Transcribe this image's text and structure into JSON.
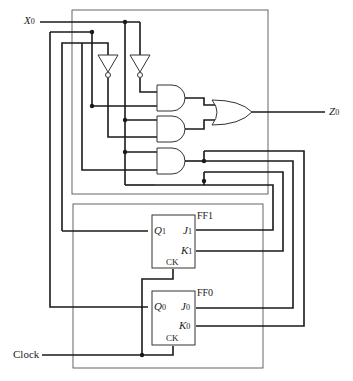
{
  "diagram": {
    "type": "sequential-logic-circuit",
    "inputs": {
      "x0": {
        "label": "X",
        "subscript": "0"
      },
      "clock": {
        "label": "Clock"
      }
    },
    "outputs": {
      "z0": {
        "label": "Z",
        "subscript": "0"
      }
    },
    "flip_flops": [
      {
        "name": "FF1",
        "q": {
          "label": "Q",
          "subscript": "1"
        },
        "j": {
          "label": "J",
          "subscript": "1"
        },
        "k": {
          "label": "K",
          "subscript": "1"
        },
        "ck": "CK"
      },
      {
        "name": "FF0",
        "q": {
          "label": "Q",
          "subscript": "0"
        },
        "j": {
          "label": "J",
          "subscript": "0"
        },
        "k": {
          "label": "K",
          "subscript": "0"
        },
        "ck": "CK"
      }
    ],
    "gates": {
      "inverters": 2,
      "and_gates": 3,
      "or_gates": 1
    },
    "colors": {
      "wire": "#1a1a1a",
      "box": "#555555",
      "background": "#ffffff"
    }
  }
}
